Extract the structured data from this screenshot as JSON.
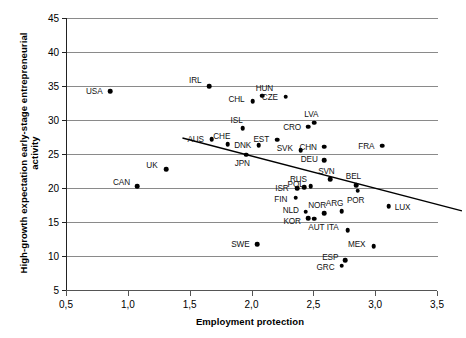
{
  "chart_data": {
    "type": "scatter",
    "title": "",
    "xlabel": "Employment protection",
    "ylabel_line1": "High-growth expectation early-stage entrepreneurial",
    "ylabel_line2": "activity",
    "xlim": [
      0.5,
      3.5
    ],
    "ylim": [
      5,
      45
    ],
    "xticks": [
      "0,5",
      "1,0",
      "1,5",
      "2,0",
      "2,5",
      "3,0",
      "3,5"
    ],
    "xtick_values": [
      0.5,
      1.0,
      1.5,
      2.0,
      2.5,
      3.0,
      3.5
    ],
    "yticks": [
      "5",
      "10",
      "15",
      "20",
      "25",
      "30",
      "35",
      "40",
      "45"
    ],
    "ytick_values": [
      5,
      10,
      15,
      20,
      25,
      30,
      35,
      40,
      45
    ],
    "grid": true,
    "grid_axis": "y",
    "legend": "none",
    "marker": "filled-diamond",
    "points": [
      {
        "label": "USA",
        "x": 0.85,
        "y": 34.2,
        "lx": -16,
        "ly": 0
      },
      {
        "label": "CAN",
        "x": 1.07,
        "y": 20.3,
        "lx": -16,
        "ly": -4
      },
      {
        "label": "UK",
        "x": 1.3,
        "y": 22.8,
        "lx": -14,
        "ly": -4
      },
      {
        "label": "IRL",
        "x": 1.65,
        "y": 35.0,
        "lx": -14,
        "ly": -6
      },
      {
        "label": "AUS",
        "x": 1.67,
        "y": 27.2,
        "lx": -16,
        "ly": 0
      },
      {
        "label": "CHE",
        "x": 1.8,
        "y": 26.4,
        "lx": -6,
        "ly": -8
      },
      {
        "label": "ISL",
        "x": 1.92,
        "y": 28.8,
        "lx": -6,
        "ly": -8
      },
      {
        "label": "CHL",
        "x": 2.0,
        "y": 32.8,
        "lx": -16,
        "ly": -2
      },
      {
        "label": "JPN",
        "x": 1.95,
        "y": 24.9,
        "lx": -4,
        "ly": 8
      },
      {
        "label": "DNK",
        "x": 2.05,
        "y": 26.3,
        "lx": -16,
        "ly": 0
      },
      {
        "label": "HUN",
        "x": 2.08,
        "y": 33.6,
        "lx": 2,
        "ly": -8
      },
      {
        "label": "EST",
        "x": 2.2,
        "y": 27.1,
        "lx": -16,
        "ly": -1
      },
      {
        "label": "CZE",
        "x": 2.27,
        "y": 33.4,
        "lx": -16,
        "ly": 0
      },
      {
        "label": "ISR",
        "x": 2.36,
        "y": 20.0,
        "lx": -15,
        "ly": 0
      },
      {
        "label": "RUS",
        "x": 2.42,
        "y": 20.1,
        "lx": -6,
        "ly": -8
      },
      {
        "label": "FIN",
        "x": 2.35,
        "y": 18.6,
        "lx": -15,
        "ly": 1
      },
      {
        "label": "SVK",
        "x": 2.39,
        "y": 25.6,
        "lx": -16,
        "ly": -2
      },
      {
        "label": "CRO",
        "x": 2.45,
        "y": 29.0,
        "lx": -16,
        "ly": 0
      },
      {
        "label": "LVA",
        "x": 2.5,
        "y": 29.6,
        "lx": -3,
        "ly": -9
      },
      {
        "label": "POL",
        "x": 2.47,
        "y": 20.3,
        "lx": -15,
        "ly": -2
      },
      {
        "label": "NLD",
        "x": 2.43,
        "y": 16.5,
        "lx": -15,
        "ly": -2
      },
      {
        "label": "KOR",
        "x": 2.45,
        "y": 15.6,
        "lx": -16,
        "ly": 3
      },
      {
        "label": "AUT",
        "x": 2.5,
        "y": 15.5,
        "lx": 2,
        "ly": 8
      },
      {
        "label": "SWE",
        "x": 2.04,
        "y": 11.7,
        "lx": -17,
        "ly": 0
      },
      {
        "label": "CHN",
        "x": 2.58,
        "y": 26.1,
        "lx": -16,
        "ly": 0
      },
      {
        "label": "DEU",
        "x": 2.58,
        "y": 24.1,
        "lx": -15,
        "ly": -1
      },
      {
        "label": "SVN",
        "x": 2.63,
        "y": 21.3,
        "lx": -4,
        "ly": -8
      },
      {
        "label": "NOR",
        "x": 2.58,
        "y": 16.3,
        "lx": -7,
        "ly": -8
      },
      {
        "label": "ARG",
        "x": 2.72,
        "y": 16.6,
        "lx": -7,
        "ly": -8
      },
      {
        "label": "BEL",
        "x": 2.84,
        "y": 20.4,
        "lx": -3,
        "ly": -9
      },
      {
        "label": "POR",
        "x": 2.85,
        "y": 19.6,
        "lx": -2,
        "ly": 9
      },
      {
        "label": "ITA",
        "x": 2.77,
        "y": 13.8,
        "lx": -15,
        "ly": -3
      },
      {
        "label": "MEX",
        "x": 2.98,
        "y": 11.4,
        "lx": -17,
        "ly": -2
      },
      {
        "label": "ESP",
        "x": 2.75,
        "y": 9.4,
        "lx": -15,
        "ly": -3
      },
      {
        "label": "GRC",
        "x": 2.72,
        "y": 8.6,
        "lx": -16,
        "ly": 1
      },
      {
        "label": "FRA",
        "x": 3.05,
        "y": 26.2,
        "lx": -16,
        "ly": 0
      },
      {
        "label": "LUX",
        "x": 3.1,
        "y": 17.3,
        "lx": 14,
        "ly": 1
      }
    ],
    "trendline": {
      "x1": 0.9,
      "y1": 30.0,
      "x2": 3.16,
      "y2": 19.3,
      "color": "#000000"
    }
  }
}
